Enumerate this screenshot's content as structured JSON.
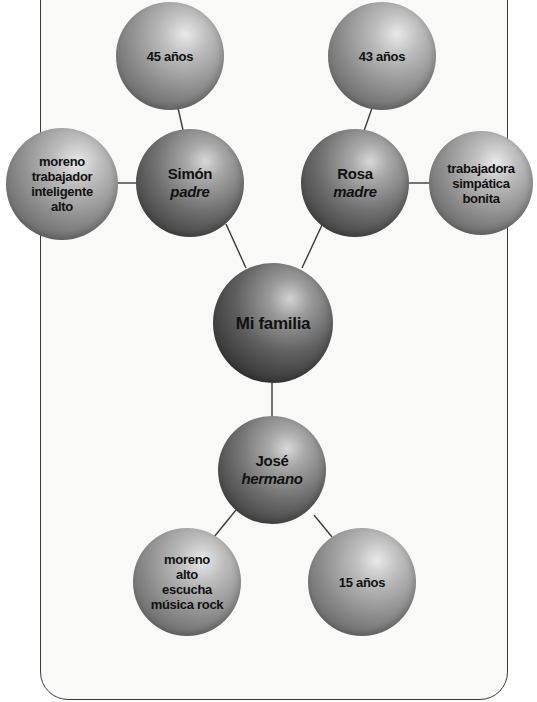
{
  "diagram": {
    "title": "Mi familia",
    "nodes": {
      "center": {
        "label": "Mi familia"
      },
      "father": {
        "name": "Simón",
        "role": "padre"
      },
      "father_age": {
        "label": "45 años"
      },
      "father_traits": {
        "lines": [
          "moreno",
          "trabajador",
          "inteligente",
          "alto"
        ]
      },
      "mother": {
        "name": "Rosa",
        "role": "madre"
      },
      "mother_age": {
        "label": "43 años"
      },
      "mother_traits": {
        "lines": [
          "trabajadora",
          "simpática",
          "bonita"
        ]
      },
      "brother": {
        "name": "José",
        "role": "hermano"
      },
      "brother_traits": {
        "lines": [
          "moreno",
          "alto",
          "escucha",
          "música rock"
        ]
      },
      "brother_age": {
        "label": "15 años"
      }
    },
    "colors": {
      "line": "#3a3a3a",
      "text": "#111111",
      "sphere_light": "#bdbdbd",
      "sphere_dark": "#3f3f3f"
    }
  }
}
